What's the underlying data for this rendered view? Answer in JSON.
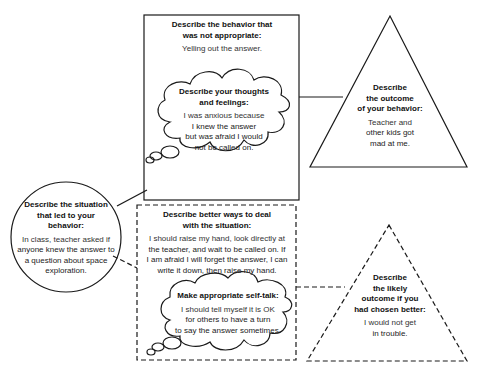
{
  "diagram": {
    "type": "behavior-reflection-organizer",
    "nodes": {
      "behavior": {
        "shape": "solid-rectangle",
        "heading": "Describe the behavior that was not appropriate:",
        "heading_lines": [
          "Describe the behavior that",
          "was not appropriate:"
        ],
        "body": "Yelling out the answer."
      },
      "thoughts": {
        "shape": "solid-thought-cloud",
        "heading_lines": [
          "Describe your thoughts",
          "and feelings:"
        ],
        "body_lines": [
          "I was anxious because",
          "I knew the answer",
          "but was afraid I would",
          "not be called on."
        ]
      },
      "outcome": {
        "shape": "solid-triangle",
        "heading_lines": [
          "Describe",
          "the outcome",
          "of your behavior:"
        ],
        "body_lines": [
          "Teacher and",
          "other kids got",
          "mad at me."
        ]
      },
      "situation": {
        "shape": "solid-circle",
        "heading_lines": [
          "Describe the situation",
          "that led to your",
          "behavior:"
        ],
        "body_lines": [
          "In class, teacher asked if",
          "anyone knew the answer to",
          "a question about space",
          "exploration."
        ]
      },
      "better_ways": {
        "shape": "dashed-rectangle",
        "heading_lines": [
          "Describe better ways to deal",
          "with the situation:"
        ],
        "body_lines": [
          "I should raise my hand, look directly at",
          "the teacher, and wait to be called on. If",
          "I am afraid I will forget the answer, I can",
          "write it down, then raise my hand."
        ]
      },
      "self_talk": {
        "shape": "solid-thought-cloud",
        "heading_lines": [
          "Make appropriate self-talk:"
        ],
        "body_lines": [
          "I should tell myself it is OK",
          "for others to have a turn",
          "to say the answer sometimes."
        ]
      },
      "likely_outcome": {
        "shape": "dashed-triangle",
        "heading_lines": [
          "Describe",
          "the likely",
          "outcome if you",
          "had chosen better:"
        ],
        "body_lines": [
          "I would not get",
          "in trouble."
        ]
      }
    },
    "edges": [
      {
        "from": "situation",
        "to": "behavior",
        "style": "solid"
      },
      {
        "from": "behavior",
        "to": "outcome",
        "style": "solid"
      },
      {
        "from": "situation",
        "to": "better_ways",
        "style": "dashed"
      },
      {
        "from": "better_ways",
        "to": "likely_outcome",
        "style": "dashed"
      }
    ],
    "colors": {
      "stroke": "#1a1a1a",
      "text": "#222222",
      "background": "#ffffff"
    }
  }
}
